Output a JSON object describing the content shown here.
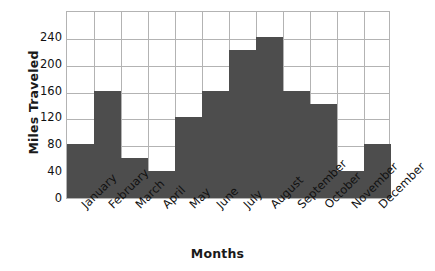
{
  "chart_data": {
    "type": "bar",
    "title": "",
    "xlabel": "Months",
    "ylabel": "Miles Traveled",
    "categories": [
      "January",
      "February",
      "March",
      "April",
      "May",
      "June",
      "July",
      "August",
      "September",
      "October",
      "November",
      "December"
    ],
    "values": [
      80,
      160,
      60,
      40,
      120,
      160,
      220,
      240,
      160,
      140,
      40,
      80
    ],
    "series": [
      {
        "name": "Miles Traveled",
        "values": [
          80,
          160,
          60,
          40,
          120,
          160,
          220,
          240,
          160,
          140,
          40,
          80
        ]
      }
    ],
    "ylim": [
      0,
      280
    ],
    "yticks": [
      0,
      40,
      80,
      120,
      160,
      200,
      240
    ],
    "ytick_labels": [
      "0",
      "40",
      "80",
      "120",
      "160",
      "200",
      "240"
    ],
    "grid": true,
    "legend": "none",
    "bar_color": "#4d4d4d",
    "grid_color": "#b3b3b3",
    "axis_color": "#b3b3b3",
    "background": "#ffffff",
    "text_color": "#111111"
  },
  "axes": {
    "y_title": "Miles Traveled",
    "x_title": "Months"
  }
}
